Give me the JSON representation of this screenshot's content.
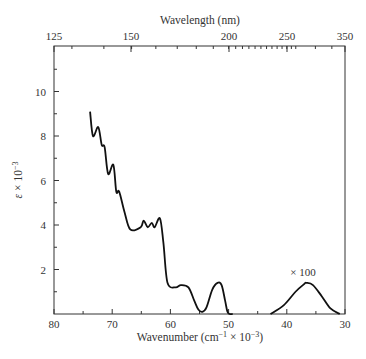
{
  "chart_data": {
    "type": "line",
    "title": "",
    "xlabel": "Wavenumber (cm⁻¹ × 10⁻³)",
    "ylabel": "ε × 10⁻³",
    "x2label": "Wavelength (nm)",
    "xlim": [
      80,
      30
    ],
    "ylim": [
      0,
      12
    ],
    "xticks": [
      80,
      70,
      60,
      50,
      40,
      30
    ],
    "yticks": [
      2,
      4,
      6,
      8,
      10
    ],
    "x2ticks": [
      125,
      150,
      200,
      250,
      350
    ],
    "grid": false,
    "annotation": "× 100",
    "series": [
      {
        "name": "absorption spectrum",
        "x": [
          73.8,
          73.3,
          72.4,
          71.8,
          71.3,
          70.7,
          69.8,
          69.3,
          68.8,
          67.9,
          66.9,
          65.1,
          64.6,
          63.9,
          63.2,
          62.7,
          61.8,
          61.2,
          60.5,
          59.1,
          58.2,
          56.9,
          55.9,
          55.2,
          54.5,
          53.8,
          52.8,
          51.9,
          51.2,
          50.6,
          50.2,
          49.8,
          49.3
        ],
        "y": [
          9.1,
          8.0,
          8.4,
          7.6,
          7.5,
          6.3,
          6.7,
          5.5,
          5.5,
          4.6,
          3.8,
          3.9,
          4.2,
          3.9,
          4.1,
          3.9,
          4.3,
          3.2,
          1.4,
          1.2,
          1.3,
          1.2,
          0.6,
          0.2,
          0.1,
          0.3,
          1.1,
          1.4,
          1.3,
          0.6,
          0.1,
          0.0,
          0.0
        ]
      },
      {
        "name": "× 100 band",
        "x": [
          42.8,
          40.5,
          38.5,
          37.0,
          36.6,
          35.5,
          34.0,
          32.5,
          30.9
        ],
        "y": [
          0.0,
          0.4,
          1.0,
          1.35,
          1.4,
          1.3,
          0.8,
          0.25,
          0.0
        ]
      }
    ]
  }
}
